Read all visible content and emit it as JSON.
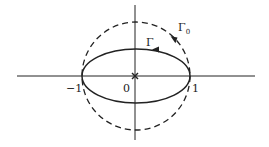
{
  "diagram": {
    "type": "complex-plane-contours",
    "colors": {
      "ink": "#222222",
      "background": "#ffffff"
    },
    "axes": {
      "origin_label": "0",
      "ticks": [
        {
          "value": -1,
          "label": "−1"
        },
        {
          "value": 1,
          "label": "1"
        }
      ]
    },
    "contours": [
      {
        "name": "Gamma_0",
        "label": "Γ",
        "subscript": "0",
        "shape": "circle",
        "radius": 1,
        "style": "dashed",
        "orientation": "counterclockwise"
      },
      {
        "name": "Gamma",
        "label": "Γ",
        "shape": "ellipse",
        "semi_axes": [
          1,
          0.5
        ],
        "style": "solid",
        "orientation": "counterclockwise"
      }
    ],
    "marker": {
      "at": "origin",
      "glyph": "×"
    }
  }
}
